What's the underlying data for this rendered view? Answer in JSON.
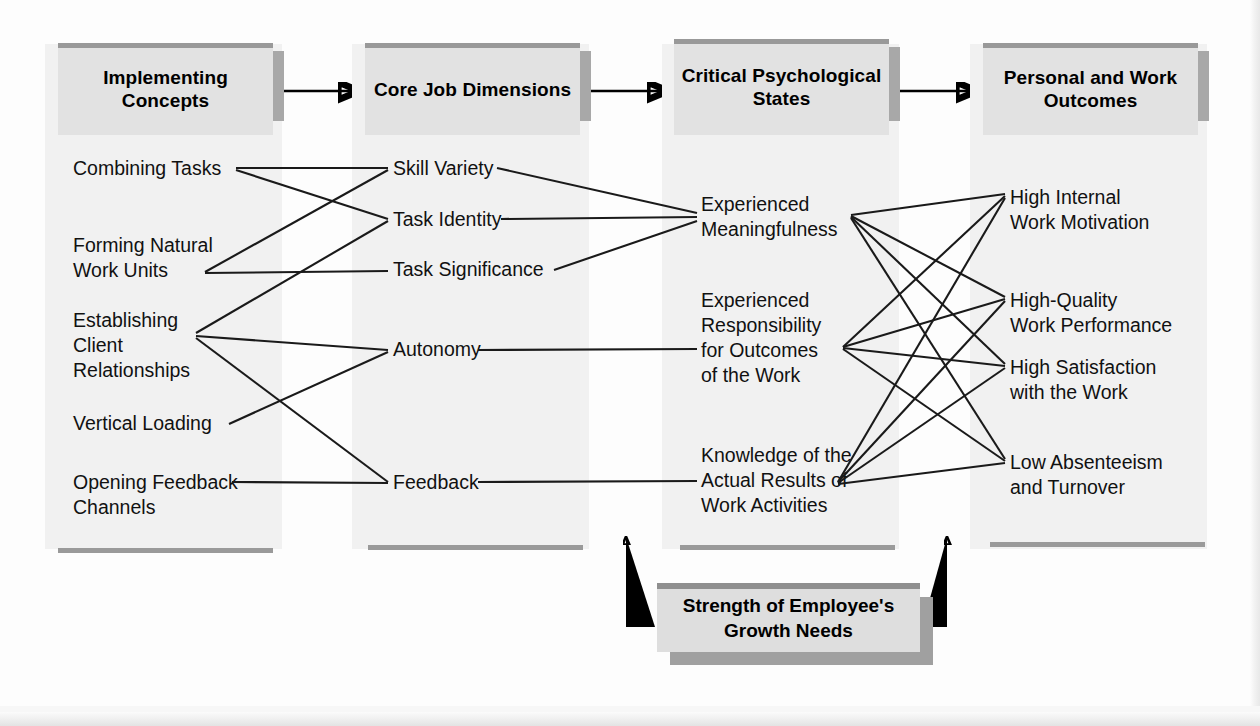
{
  "diagram": {
    "columns": [
      {
        "id": "implementing-concepts",
        "header": "Implementing\nConcepts",
        "items": [
          "Combining Tasks",
          "Forming Natural\nWork Units",
          "Establishing\nClient\nRelationships",
          "Vertical Loading",
          "Opening Feedback\nChannels"
        ]
      },
      {
        "id": "core-job-dimensions",
        "header": "Core Job\nDimensions",
        "items": [
          "Skill Variety",
          "Task Identity",
          "Task Significance",
          "Autonomy",
          "Feedback"
        ]
      },
      {
        "id": "critical-psychological-states",
        "header": "Critical\nPsychological\nStates",
        "items": [
          "Experienced\nMeaningfulness",
          "Experienced\nResponsibility\nfor Outcomes\nof the Work",
          "Knowledge of the\nActual Results of\nWork Activities"
        ]
      },
      {
        "id": "personal-and-work-outcomes",
        "header": "Personal and\nWork Outcomes",
        "items": [
          "High Internal\nWork Motivation",
          "High-Quality\nWork Performance",
          "High Satisfaction\nwith the Work",
          "Low Absenteeism\nand Turnover"
        ]
      }
    ],
    "moderator": {
      "label": "Strength of Employee's\nGrowth Needs"
    },
    "colors": {
      "header_fill": "#e2e2e2",
      "header_cap": "#999999",
      "panel_fill": "#f1f1f1",
      "shadow": "#a8a8a8",
      "line": "#1a1a1a",
      "text": "#111111"
    }
  }
}
